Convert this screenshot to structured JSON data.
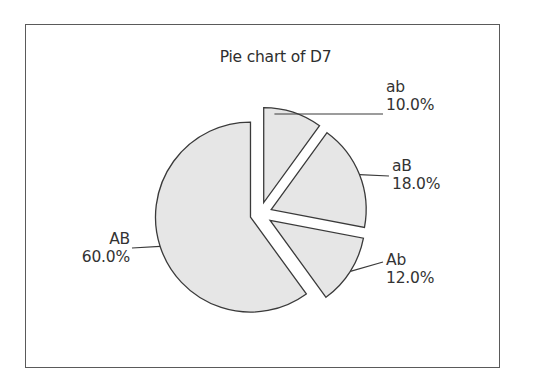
{
  "chart_data": {
    "type": "pie",
    "title": "Pie chart of D7",
    "categories": [
      "ab",
      "aB",
      "Ab",
      "AB"
    ],
    "values": [
      10.0,
      18.0,
      12.0,
      60.0
    ],
    "value_labels": [
      "10.0%",
      "18.0%",
      "12.0%",
      "60.0%"
    ],
    "start_angle": "12 o'clock",
    "direction": "clockwise",
    "exploded": true,
    "slice_fill": "#e6e6e6",
    "slice_stroke": "#3a3a3a",
    "legend": "none (callout labels)"
  },
  "labels": [
    {
      "category": "ab",
      "value": "10.0%"
    },
    {
      "category": "aB",
      "value": "18.0%"
    },
    {
      "category": "Ab",
      "value": "12.0%"
    },
    {
      "category": "AB",
      "value": "60.0%"
    }
  ]
}
